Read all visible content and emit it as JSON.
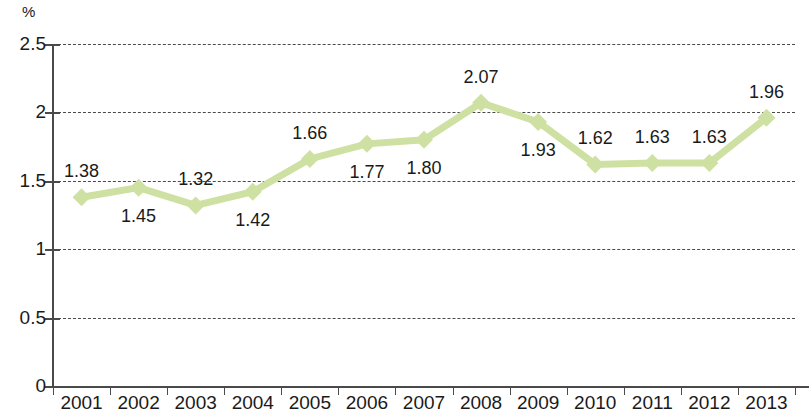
{
  "chart_data": {
    "type": "line",
    "title": "",
    "subtitle": "",
    "xlabel": "",
    "ylabel": "%",
    "unit_label": "%",
    "categories": [
      "2001",
      "2002",
      "2003",
      "2004",
      "2005",
      "2006",
      "2007",
      "2008",
      "2009",
      "2010",
      "2011",
      "2012",
      "2013"
    ],
    "values": [
      1.38,
      1.45,
      1.32,
      1.42,
      1.66,
      1.77,
      1.8,
      2.07,
      1.93,
      1.62,
      1.63,
      1.63,
      1.96
    ],
    "point_labels": [
      "1.38",
      "1.45",
      "1.32",
      "1.42",
      "1.66",
      "1.77",
      "1.80",
      "2.07",
      "1.93",
      "1.62",
      "1.63",
      "1.63",
      "1.96"
    ],
    "label_positions": [
      "above",
      "below",
      "above",
      "below",
      "above",
      "below",
      "below",
      "above",
      "below",
      "above",
      "above",
      "above",
      "above"
    ],
    "ylim": [
      0,
      2.5
    ],
    "ytick_values": [
      0,
      0.5,
      1,
      1.5,
      2,
      2.5
    ],
    "ytick_labels": [
      "0",
      "0.5",
      "1",
      "1.5",
      "2",
      "2.5"
    ],
    "grid": true,
    "grid_style": "dashed",
    "legend": "none",
    "series_color": "#cfe0a3",
    "marker": "diamond",
    "axis_color": "#4a4a4a",
    "text_color": "#1a1a1a",
    "background": "#ffffff"
  }
}
